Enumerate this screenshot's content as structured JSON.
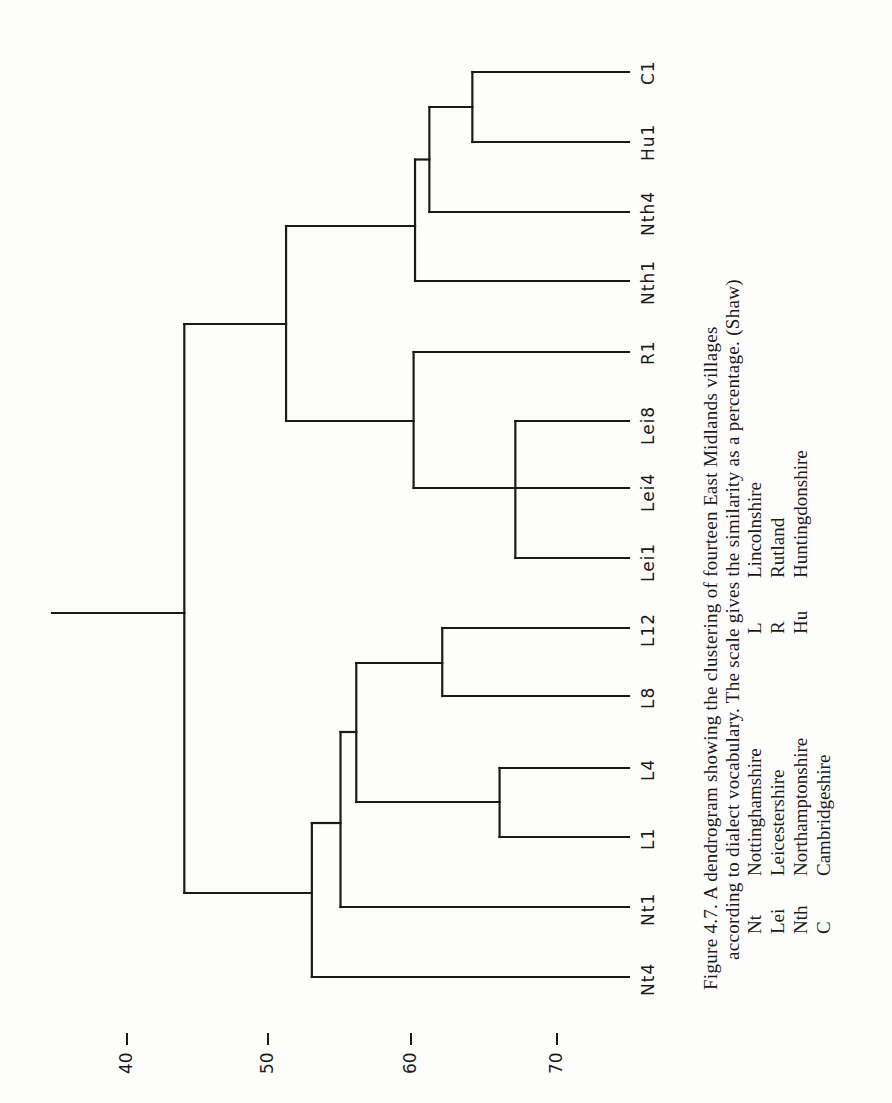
{
  "figure": {
    "caption_line1": "Figure 4.7.  A  dendrogram  showing  the  clustering  of  fourteen  East  Midlands  villages",
    "caption_line2": "according to dialect vocabulary. The scale gives the similarity as a percentage. (Shaw)",
    "legend_left": [
      {
        "abbr": "Nt",
        "name": "Nottinghamshire"
      },
      {
        "abbr": "Lei",
        "name": "Leicestershire"
      },
      {
        "abbr": "Nth",
        "name": "Northamptonshire"
      },
      {
        "abbr": "C",
        "name": "Cambridgeshire"
      }
    ],
    "legend_right": [
      {
        "abbr": "L",
        "name": "Lincolnshire"
      },
      {
        "abbr": "R",
        "name": "Rutland"
      },
      {
        "abbr": "Hu",
        "name": "Huntingdonshire"
      }
    ],
    "line_color": "#1a1a1a",
    "background": "#fdfdfb"
  },
  "chart_data": {
    "type": "dendrogram",
    "title": "A dendrogram showing the clustering of fourteen East Midlands villages according to dialect vocabulary",
    "orientation": "rotated 90° counter-clockwise (similarity axis runs left-to-right along page bottom)",
    "axis": {
      "label": "Similarity (%)",
      "ticks": [
        40,
        50,
        60,
        70
      ],
      "range": [
        40,
        75
      ]
    },
    "leaves": [
      "C1",
      "Hu1",
      "Nth4",
      "Nth1",
      "R1",
      "Lei8",
      "Lei4",
      "Lei1",
      "L12",
      "L8",
      "L4",
      "L1",
      "Nt1",
      "Nt4"
    ],
    "merges": [
      {
        "children": [
          "Lei1",
          "Lei4",
          "Lei8"
        ],
        "similarity": 67
      },
      {
        "children": [
          "L1",
          "L4"
        ],
        "similarity": 66
      },
      {
        "children": [
          "C1",
          "Hu1"
        ],
        "similarity": 64
      },
      {
        "children": [
          "L8",
          "L12"
        ],
        "similarity": 62
      },
      {
        "children": [
          "(C1,Hu1)",
          "Nth4"
        ],
        "similarity": 61
      },
      {
        "children": [
          "((C1,Hu1),Nth4)",
          "Nth1"
        ],
        "similarity": 60
      },
      {
        "children": [
          "(Lei1,Lei4,Lei8)",
          "R1"
        ],
        "similarity": 60
      },
      {
        "children": [
          "(L8,L12)",
          "(L1,L4)"
        ],
        "similarity": 56
      },
      {
        "children": [
          "((L8,L12),(L1,L4))",
          "Nt1"
        ],
        "similarity": 55
      },
      {
        "children": [
          "(L-group,Nt1)",
          "Nt4"
        ],
        "similarity": 53
      },
      {
        "children": [
          "(Nth/Hu/C group)",
          "(R1,Lei group)"
        ],
        "similarity": 51
      },
      {
        "children": [
          "(eastern group)",
          "(western group)"
        ],
        "similarity": 44
      }
    ]
  },
  "layout": {
    "px_per_percent": 14.33,
    "x_at_40": 127,
    "leaf_end_x": 629,
    "root_stem_start_x": 52,
    "leaf_y": {
      "C1": 72,
      "Hu1": 142,
      "Nth4": 212,
      "Nth1": 281,
      "R1": 352,
      "Lei8": 421,
      "Lei4": 488,
      "Lei1": 558,
      "L12": 628,
      "L8": 696,
      "L4": 768,
      "L1": 837,
      "Nt1": 907,
      "Nt4": 977
    },
    "tick_x": {
      "40": 127,
      "50": 268,
      "60": 411,
      "70": 557
    }
  }
}
